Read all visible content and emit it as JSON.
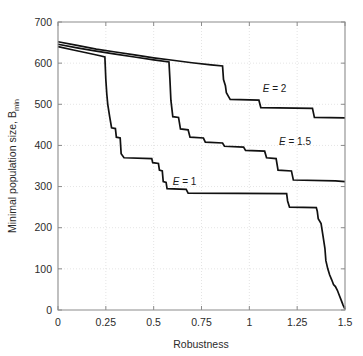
{
  "chart_data": {
    "type": "line",
    "title": "",
    "xlabel": "Robustness",
    "ylabel": "Minimal population size, B",
    "ylabel_subscript": "min",
    "xlim": [
      0,
      1.5
    ],
    "ylim": [
      0,
      700
    ],
    "xticks": [
      0,
      0.25,
      0.5,
      0.75,
      1,
      1.25,
      1.5
    ],
    "xtick_labels": [
      "0",
      "0.25",
      "0.5",
      "0.75",
      "1",
      "1.25",
      "1.5"
    ],
    "yticks": [
      0,
      100,
      200,
      300,
      400,
      500,
      600,
      700
    ],
    "ytick_labels": [
      "0",
      "100",
      "200",
      "300",
      "400",
      "500",
      "600",
      "700"
    ],
    "grid": true,
    "grid_style": "dotted",
    "legend_position": "inline-annotations",
    "line_color": "#111111",
    "series": [
      {
        "name": "E = 2",
        "label": "E = 2",
        "label_x": 1.07,
        "label_y": 530,
        "points": [
          [
            0.0,
            652
          ],
          [
            0.1,
            643
          ],
          [
            0.2,
            634
          ],
          [
            0.3,
            627
          ],
          [
            0.4,
            620
          ],
          [
            0.5,
            613
          ],
          [
            0.6,
            607
          ],
          [
            0.7,
            601
          ],
          [
            0.8,
            596
          ],
          [
            0.86,
            593
          ],
          [
            0.865,
            560
          ],
          [
            0.875,
            545
          ],
          [
            0.88,
            528
          ],
          [
            0.89,
            520
          ],
          [
            0.9,
            512
          ],
          [
            1.05,
            510
          ],
          [
            1.06,
            492
          ],
          [
            1.33,
            490
          ],
          [
            1.34,
            468
          ],
          [
            1.5,
            467
          ]
        ]
      },
      {
        "name": "E = 1.5",
        "label": "E = 1.5",
        "label_x": 1.155,
        "label_y": 400,
        "points": [
          [
            0.0,
            646
          ],
          [
            0.1,
            637
          ],
          [
            0.2,
            629
          ],
          [
            0.3,
            622
          ],
          [
            0.4,
            615
          ],
          [
            0.5,
            608
          ],
          [
            0.58,
            603
          ],
          [
            0.585,
            560
          ],
          [
            0.59,
            510
          ],
          [
            0.6,
            470
          ],
          [
            0.63,
            468
          ],
          [
            0.64,
            440
          ],
          [
            0.68,
            438
          ],
          [
            0.69,
            420
          ],
          [
            0.76,
            418
          ],
          [
            0.77,
            408
          ],
          [
            0.86,
            406
          ],
          [
            0.87,
            398
          ],
          [
            0.97,
            396
          ],
          [
            0.98,
            388
          ],
          [
            1.08,
            386
          ],
          [
            1.09,
            370
          ],
          [
            1.14,
            368
          ],
          [
            1.15,
            340
          ],
          [
            1.22,
            338
          ],
          [
            1.23,
            316
          ],
          [
            1.45,
            314
          ],
          [
            1.5,
            312
          ]
        ]
      },
      {
        "name": "E = 1",
        "label": "E = 1",
        "label_x": 0.6,
        "label_y": 305,
        "points": [
          [
            0.0,
            640
          ],
          [
            0.08,
            632
          ],
          [
            0.16,
            624
          ],
          [
            0.22,
            618
          ],
          [
            0.245,
            615
          ],
          [
            0.25,
            560
          ],
          [
            0.255,
            525
          ],
          [
            0.26,
            500
          ],
          [
            0.27,
            470
          ],
          [
            0.28,
            443
          ],
          [
            0.3,
            441
          ],
          [
            0.305,
            420
          ],
          [
            0.325,
            418
          ],
          [
            0.33,
            380
          ],
          [
            0.345,
            370
          ],
          [
            0.49,
            368
          ],
          [
            0.495,
            358
          ],
          [
            0.525,
            356
          ],
          [
            0.53,
            340
          ],
          [
            0.545,
            338
          ],
          [
            0.55,
            312
          ],
          [
            0.565,
            310
          ],
          [
            0.57,
            295
          ],
          [
            0.67,
            293
          ],
          [
            0.68,
            284
          ],
          [
            1.195,
            283
          ],
          [
            1.2,
            265
          ],
          [
            1.21,
            250
          ],
          [
            1.35,
            249
          ],
          [
            1.355,
            240
          ],
          [
            1.36,
            222
          ],
          [
            1.375,
            210
          ],
          [
            1.385,
            180
          ],
          [
            1.395,
            150
          ],
          [
            1.4,
            120
          ],
          [
            1.41,
            100
          ],
          [
            1.42,
            85
          ],
          [
            1.43,
            74
          ],
          [
            1.44,
            62
          ],
          [
            1.45,
            57
          ],
          [
            1.46,
            48
          ],
          [
            1.47,
            36
          ],
          [
            1.48,
            24
          ],
          [
            1.49,
            12
          ],
          [
            1.5,
            2
          ]
        ]
      }
    ]
  }
}
